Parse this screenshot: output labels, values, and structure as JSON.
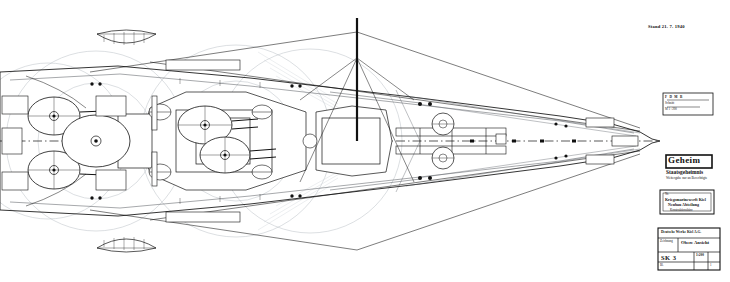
{
  "sheet": {
    "background_color": "#ffffff",
    "ink_color": "#111111",
    "construction_color": "#9aa0a8",
    "faint_color": "#c2c7cd",
    "width": 730,
    "height": 282,
    "drawing_type": "naval architectural deck plan",
    "orientation": "plan view, bow to the right"
  },
  "annotations": {
    "top_right_note": "Stand 21. 7. 1940"
  },
  "stamps": {
    "secret": {
      "label": "Geheim",
      "line2": "Staatsgeheimnis",
      "line3": "Weitergabe nur an Berechtigte",
      "box_color": "#1a1a1a"
    },
    "authority": {
      "line1": "Nr.",
      "line2": "Kriegsmarinewerft Kiel",
      "line3": "Neubau Abteilung",
      "line4": "Konstruktionsbüro"
    },
    "small_label": {
      "line1": "F  D  M  B",
      "line2": "Schnitt",
      "line3": "M 1 : 200"
    }
  },
  "title_block": {
    "header": "Deutsche Werke Kiel A.G.",
    "subject_label": "Gegenstand",
    "subject_value": "Obere Ansicht",
    "left_label": "Zeichnung",
    "drawing_no": "SK 3",
    "scale_label": "Maßstab",
    "scale_value": "1:200",
    "blatt_label": "Bl.",
    "blatt_value": "1"
  },
  "ship": {
    "name_class": "Schlachtschiff",
    "centerline_style": "dash-dot",
    "turrets": [
      {
        "id": "A",
        "name": "turret-a-forward-super",
        "cx": 205,
        "cy": 125,
        "r": 26
      },
      {
        "id": "B",
        "name": "turret-b-forward",
        "cx": 223,
        "cy": 152,
        "r": 23
      },
      {
        "id": "C",
        "name": "turret-c-aft",
        "cx": 52,
        "cy": 118,
        "r": 24
      },
      {
        "id": "D",
        "name": "turret-d-aft-super",
        "cx": 52,
        "cy": 168,
        "r": 24
      }
    ],
    "firing_arcs": [
      {
        "name": "arc-forward-main",
        "cx": 236,
        "cy": 141,
        "r": 96
      },
      {
        "name": "arc-midship-main",
        "cx": 310,
        "cy": 141,
        "r": 92
      },
      {
        "name": "arc-aft-main",
        "cx": 96,
        "cy": 141,
        "r": 90
      },
      {
        "name": "arc-aft-secondary",
        "cx": 48,
        "cy": 141,
        "r": 78
      }
    ],
    "boats": [
      {
        "name": "ships-boat-port-fwd",
        "x": 95,
        "y": 32,
        "w": 62,
        "h": 20
      },
      {
        "name": "ships-boat-stbd-fwd",
        "x": 95,
        "y": 230,
        "w": 62,
        "h": 20
      }
    ],
    "mast": {
      "name": "main-mast",
      "x": 357,
      "y_top": 18,
      "y_bottom": 141
    },
    "capstans": [
      {
        "name": "capstan-port",
        "cx": 443,
        "cy": 124,
        "r": 11
      },
      {
        "name": "capstan-stbd",
        "cx": 443,
        "cy": 158,
        "r": 11
      }
    ]
  }
}
